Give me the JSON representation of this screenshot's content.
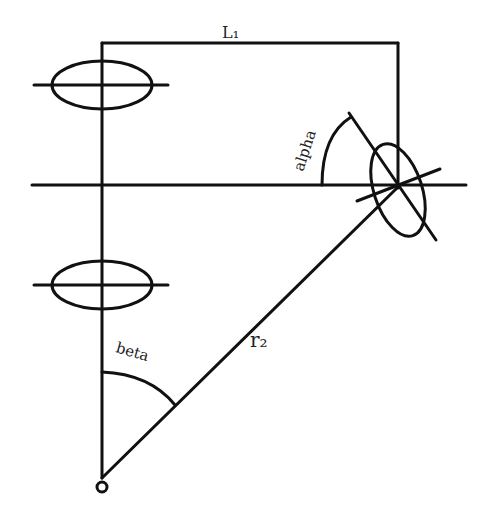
{
  "diagram": {
    "labels": {
      "L1": "L₁",
      "alpha": "alpha",
      "beta": "beta",
      "r2": "r₂",
      "origin": "o"
    },
    "colors": {
      "stroke": "#111111",
      "background": "#ffffff"
    },
    "elements": [
      "vertical axis from origin",
      "top horizontal bar labeled L1",
      "upper fixed ellipse",
      "lower fixed ellipse",
      "long horizontal line",
      "tilted ellipse at right end",
      "angle arc alpha",
      "radius line r2 from origin",
      "angle arc beta"
    ]
  }
}
